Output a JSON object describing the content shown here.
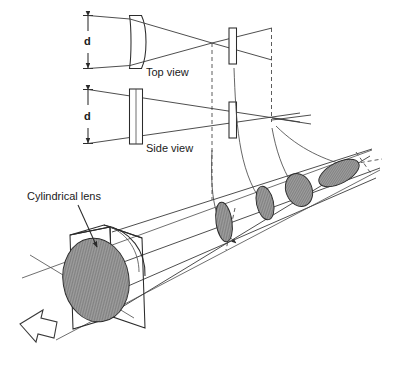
{
  "figure": {
    "background_color": "#ffffff",
    "line_color": "#3a3a3a",
    "hatch_fill_color": "#9a9a9a"
  },
  "labels": {
    "top_view": "Top view",
    "side_view": "Side view",
    "cylindrical_lens": "Cylindrical lens",
    "dimension_top": "d",
    "dimension_side": "d"
  },
  "panels": [
    {
      "name": "top-view",
      "label": "Top view",
      "dimension_label": "d",
      "lens_type": "plano-convex",
      "aperture": "slit",
      "beam": "converging-then-diverging"
    },
    {
      "name": "side-view",
      "label": "Side view",
      "dimension_label": "d",
      "lens_type": "plane-parallel-plate",
      "aperture": "slit",
      "beam": "converging-to-far-focus"
    }
  ],
  "perspective": {
    "label": "Cylindrical lens",
    "element": "cylindrical-lens-block",
    "beam_cross_sections": [
      {
        "index": 1,
        "shape": "tall-narrow-ellipse"
      },
      {
        "index": 2,
        "shape": "tall-ellipse"
      },
      {
        "index": 3,
        "shape": "round-ellipse"
      },
      {
        "index": 4,
        "shape": "wide-tilted-ellipse"
      }
    ],
    "direction_arrow": "block-arrow-up-left"
  },
  "icons": {
    "block_arrow": "block-arrow-icon",
    "leader_line": "leader-line-icon",
    "dimension_arrow": "dimension-arrow-icon",
    "mapping_arrow": "curved-mapping-arrow-icon"
  }
}
